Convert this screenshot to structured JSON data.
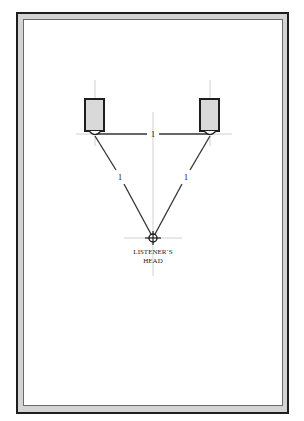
{
  "diagram": {
    "speaker_spacing_label": "1",
    "left_distance_label": "1",
    "right_distance_label": "1",
    "listener_label_line1": "LISTENER`S",
    "listener_label_line2": "HEAD",
    "colors": {
      "frame_dark": "#1e1e1e",
      "frame_band": "#d4d4d4",
      "speaker_fill": "#d9d9d9",
      "line": "#333333",
      "guide": "#bdbdbd"
    },
    "elements": [
      {
        "type": "speaker",
        "side": "left"
      },
      {
        "type": "speaker",
        "side": "right"
      },
      {
        "type": "listener",
        "label": "LISTENER`S HEAD"
      }
    ]
  }
}
